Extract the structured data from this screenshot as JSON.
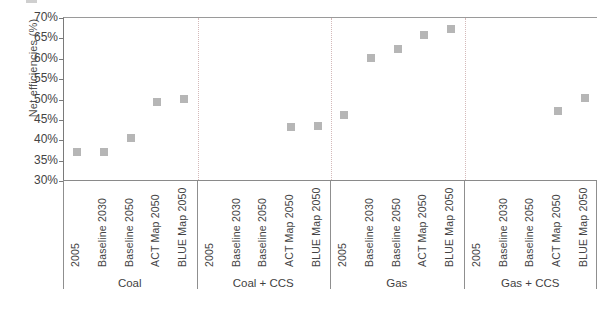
{
  "chart_data": {
    "type": "scatter",
    "title": "",
    "xlabel": "",
    "ylabel": "Net efficiencies (%)",
    "ylim": [
      30,
      70
    ],
    "ytick_labels": [
      "70%",
      "65%",
      "60%",
      "55%",
      "50%",
      "45%",
      "40%",
      "35%",
      "30%"
    ],
    "ytick_values": [
      70,
      65,
      60,
      55,
      50,
      45,
      40,
      35,
      30
    ],
    "grid": false,
    "legend": "none",
    "marker_color": "#b6b6b6",
    "categories": [
      "2005",
      "Baseline 2030",
      "Baseline 2050",
      "ACT Map 2050",
      "BLUE Map 2050"
    ],
    "groups": [
      {
        "name": "Coal",
        "points": [
          {
            "category": "2005",
            "value": 37.0
          },
          {
            "category": "Baseline 2030",
            "value": 37.0
          },
          {
            "category": "Baseline 2050",
            "value": 40.5
          },
          {
            "category": "ACT Map 2050",
            "value": 49.3
          },
          {
            "category": "BLUE Map 2050",
            "value": 50.2
          }
        ]
      },
      {
        "name": "Coal + CCS",
        "points": [
          {
            "category": "2005",
            "value": null
          },
          {
            "category": "Baseline 2030",
            "value": null
          },
          {
            "category": "Baseline 2050",
            "value": null
          },
          {
            "category": "ACT Map 2050",
            "value": 43.3
          },
          {
            "category": "BLUE Map 2050",
            "value": 43.6
          }
        ]
      },
      {
        "name": "Gas",
        "points": [
          {
            "category": "2005",
            "value": 46.2
          },
          {
            "category": "Baseline 2030",
            "value": 60.3
          },
          {
            "category": "Baseline 2050",
            "value": 62.3
          },
          {
            "category": "ACT Map 2050",
            "value": 65.9
          },
          {
            "category": "BLUE Map 2050",
            "value": 67.3
          }
        ]
      },
      {
        "name": "Gas + CCS",
        "points": [
          {
            "category": "2005",
            "value": null
          },
          {
            "category": "Baseline 2030",
            "value": null
          },
          {
            "category": "Baseline 2050",
            "value": null
          },
          {
            "category": "ACT Map 2050",
            "value": 47.2
          },
          {
            "category": "BLUE Map 2050",
            "value": 50.3
          }
        ]
      }
    ]
  }
}
